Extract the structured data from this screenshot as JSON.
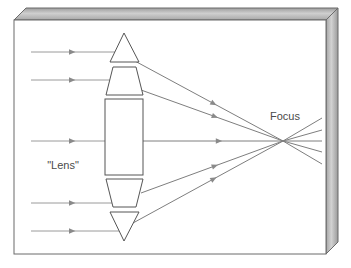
{
  "figure": {
    "kind": "optics-ray-diagram",
    "background_color": "#ffffff",
    "frame": {
      "border_color": "#6b6b6b",
      "bevel_light": "#d8d8d8",
      "bevel_mid": "#b0b0b0",
      "bevel_dark": "#8c8c8c",
      "inner_rect": {
        "x": 14,
        "y": 20,
        "w": 312,
        "h": 234
      },
      "depth_x": 12,
      "depth_y": 12
    },
    "labels": {
      "lens": "\"Lens\"",
      "focus": "Focus"
    },
    "label_positions": {
      "lens": {
        "x": 63,
        "y": 169
      },
      "focus": {
        "x": 270,
        "y": 120
      },
      "lens_color": "#4a4a4a",
      "focus_color": "#4a4a4a"
    },
    "ray_color": "#9a9a9a",
    "ray_color_dark": "#7e7e7e",
    "outline_color": "#555555",
    "focus_point": {
      "x": 283,
      "y": 141
    },
    "rays_in": [
      {
        "y": 52,
        "x_start": 31,
        "x_end": 116,
        "arrow_x": 69
      },
      {
        "y": 80,
        "x_start": 31,
        "x_end": 112,
        "arrow_x": 69
      },
      {
        "y": 141,
        "x_start": 31,
        "x_end": 105,
        "arrow_x": 69
      },
      {
        "y": 203,
        "x_start": 31,
        "x_end": 112,
        "arrow_x": 69
      },
      {
        "y": 231,
        "x_start": 31,
        "x_end": 119,
        "arrow_x": 69
      }
    ],
    "rays_out": [
      {
        "x_start": 133,
        "y_start": 60,
        "arrow_t": 0.52
      },
      {
        "x_start": 141,
        "y_start": 90,
        "arrow_t": 0.5
      },
      {
        "x_start": 143,
        "y_start": 141,
        "arrow_t": 0.52
      },
      {
        "x_start": 141,
        "y_start": 193,
        "arrow_t": 0.5
      },
      {
        "x_start": 133,
        "y_start": 223,
        "arrow_t": 0.52
      }
    ],
    "rays_past_focus": [
      {
        "x_end": 322,
        "y_end": 118
      },
      {
        "x_end": 322,
        "y_end": 130
      },
      {
        "x_end": 322,
        "y_end": 141
      },
      {
        "x_end": 322,
        "y_end": 152
      },
      {
        "x_end": 322,
        "y_end": 164
      }
    ],
    "lens_elements": [
      {
        "name": "top-prism-triangle",
        "shape": "polygon",
        "points": "124,33 139,62 110,62"
      },
      {
        "name": "upper-trapezoid",
        "shape": "polygon",
        "points": "113,67 136,67 143,95 106,95"
      },
      {
        "name": "center-rectangle",
        "shape": "rect",
        "x": 105,
        "y": 99,
        "w": 38,
        "h": 76
      },
      {
        "name": "lower-trapezoid",
        "shape": "polygon",
        "points": "106,179 143,179 136,207 113,207"
      },
      {
        "name": "bottom-prism-triangle",
        "shape": "polygon",
        "points": "110,212 139,212 124,241"
      }
    ]
  }
}
